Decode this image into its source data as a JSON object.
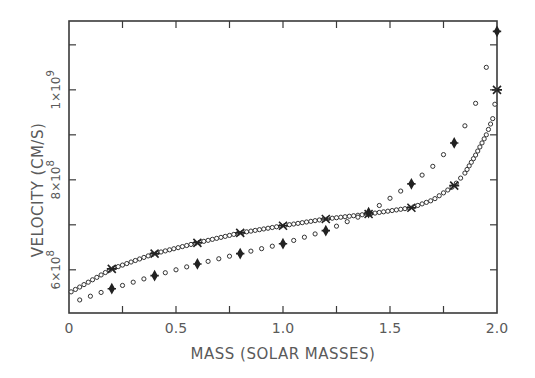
{
  "chart_data": {
    "type": "scatter",
    "title": "",
    "xlabel": "MASS (SOLAR MASSES)",
    "ylabel": "VELOCITY (CM/S)",
    "xlim": [
      0,
      2.0
    ],
    "ylim": [
      504000000.0,
      1153000000.0
    ],
    "x_ticks": [
      0,
      0.25,
      0.5,
      0.75,
      1.0,
      1.25,
      1.5,
      1.75,
      2.0
    ],
    "x_tick_labels": [
      {
        "value": 0,
        "label": "0"
      },
      {
        "value": 0.5,
        "label": "0.5"
      },
      {
        "value": 1.0,
        "label": "1.0"
      },
      {
        "value": 1.5,
        "label": "1.5"
      },
      {
        "value": 2.0,
        "label": "2.0"
      }
    ],
    "y_ticks": [
      600000000.0,
      700000000.0,
      800000000.0,
      900000000.0,
      1000000000.0,
      1100000000.0
    ],
    "y_tick_labels": [
      {
        "value": 600000000.0,
        "mantissa": "6×10",
        "exp": "8"
      },
      {
        "value": 800000000.0,
        "mantissa": "8×10",
        "exp": "8"
      },
      {
        "value": 1000000000.0,
        "mantissa": "1×10",
        "exp": "9"
      }
    ],
    "grid": false,
    "legend": null,
    "series": [
      {
        "name": "upper curve (dense circles, x-star markers every 0.2)",
        "marker": "circle",
        "highlight_marker": "star",
        "x": [
          0.01,
          0.2,
          0.4,
          0.6,
          0.8,
          1.0,
          1.2,
          1.4,
          1.6,
          1.7,
          1.8,
          1.85,
          1.9,
          1.95,
          1.98,
          2.0
        ],
        "values": [
          551000000.0,
          602000000.0,
          636000000.0,
          660000000.0,
          682000000.0,
          698000000.0,
          713000000.0,
          724000000.0,
          738000000.0,
          755000000.0,
          787000000.0,
          815000000.0,
          855000000.0,
          900000000.0,
          936000000.0,
          1000000000.0
        ],
        "highlight_x": [
          0.2,
          0.4,
          0.6,
          0.8,
          1.0,
          1.2,
          1.4,
          1.6,
          1.8,
          2.0
        ]
      },
      {
        "name": "lower curve (sparse circles, diamond markers every 0.2)",
        "marker": "circle",
        "highlight_marker": "diamond",
        "x": [
          0.05,
          0.2,
          0.4,
          0.6,
          0.8,
          1.0,
          1.2,
          1.4,
          1.6,
          1.7,
          1.8,
          1.85,
          1.9,
          1.95,
          2.0
        ],
        "values": [
          533000000.0,
          558000000.0,
          587000000.0,
          613000000.0,
          636000000.0,
          658000000.0,
          687000000.0,
          727000000.0,
          791000000.0,
          830000000.0,
          882000000.0,
          920000000.0,
          970000000.0,
          1050000000.0,
          1130000000.0
        ],
        "highlight_x": [
          0.2,
          0.4,
          0.6,
          0.8,
          1.0,
          1.2,
          1.4,
          1.6,
          1.8,
          2.0
        ]
      }
    ]
  },
  "labels": {
    "xlabel": "MASS (SOLAR MASSES)",
    "ylabel": "VELOCITY (CM/S)"
  }
}
